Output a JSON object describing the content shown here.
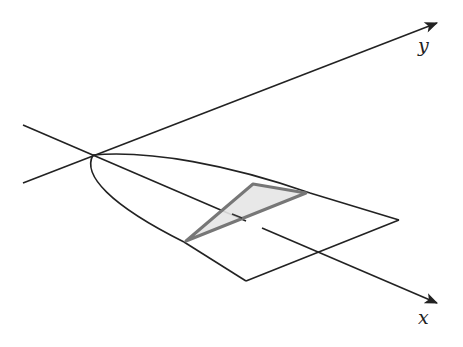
{
  "diagram": {
    "type": "3d-region-sketch",
    "axes": {
      "x": {
        "label": "x",
        "from": [
          23,
          125
        ],
        "to": [
          437,
          303
        ],
        "label_pos": [
          420,
          327
        ]
      },
      "y": {
        "label": "y",
        "from": [
          23,
          183
        ],
        "to": [
          437,
          23
        ],
        "label_pos": [
          420,
          50
        ]
      }
    },
    "origin": [
      93,
      155
    ],
    "parabola": {
      "upper_branch_end": [
        310,
        193
      ],
      "lower_branch_end": [
        184,
        242
      ]
    },
    "base_quad": {
      "vertices": [
        [
          184,
          242
        ],
        [
          310,
          193
        ],
        [
          399,
          220
        ],
        [
          246,
          281
        ]
      ]
    },
    "cross_section_triangle": {
      "vertices": [
        [
          186,
          241
        ],
        [
          253,
          184
        ],
        [
          306,
          193
        ]
      ],
      "fill": "#e6e6e6",
      "stroke": "#777777"
    },
    "colors": {
      "line": "#222222",
      "triangle_fill": "#e6e6e6",
      "triangle_stroke": "#777777"
    }
  },
  "top_cut_text": ""
}
